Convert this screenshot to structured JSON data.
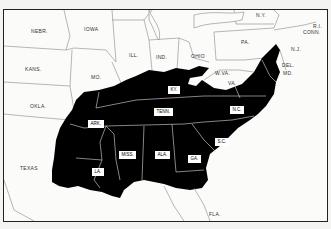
{
  "map": {
    "shaded_color": "#000000",
    "background_color": "#fbfbfa",
    "border_color": "#222222",
    "unshaded_states": [
      {
        "label": "NEBR.",
        "x": 27,
        "y": 18
      },
      {
        "label": "IOWA",
        "x": 80,
        "y": 16
      },
      {
        "label": "ILL.",
        "x": 125,
        "y": 42
      },
      {
        "label": "IND.",
        "x": 152,
        "y": 44
      },
      {
        "label": "OHIO",
        "x": 187,
        "y": 43
      },
      {
        "label": "PA.",
        "x": 237,
        "y": 29
      },
      {
        "label": "N.Y.",
        "x": 252,
        "y": 2
      },
      {
        "label": "N.J.",
        "x": 287,
        "y": 36
      },
      {
        "label": "CONN.",
        "x": 299,
        "y": 19
      },
      {
        "label": "R.I.",
        "x": 309,
        "y": 13
      },
      {
        "label": "DEL.",
        "x": 278,
        "y": 52
      },
      {
        "label": "MD.",
        "x": 279,
        "y": 60
      },
      {
        "label": "W.VA.",
        "x": 211,
        "y": 60
      },
      {
        "label": "VA.",
        "x": 224,
        "y": 70
      },
      {
        "label": "KANS.",
        "x": 21,
        "y": 56
      },
      {
        "label": "MO.",
        "x": 87,
        "y": 64
      },
      {
        "label": "OKLA.",
        "x": 26,
        "y": 93
      },
      {
        "label": "TEXAS",
        "x": 16,
        "y": 155
      },
      {
        "label": "FLA.",
        "x": 205,
        "y": 201
      }
    ],
    "shaded_states": [
      {
        "label": "KY.",
        "x": 164,
        "y": 76
      },
      {
        "label": "TENN.",
        "x": 150,
        "y": 98
      },
      {
        "label": "N.C.",
        "x": 226,
        "y": 96
      },
      {
        "label": "ARK.",
        "x": 84,
        "y": 110
      },
      {
        "label": "S.C.",
        "x": 211,
        "y": 128
      },
      {
        "label": "MISS.",
        "x": 115,
        "y": 141
      },
      {
        "label": "ALA.",
        "x": 151,
        "y": 141
      },
      {
        "label": "GA.",
        "x": 184,
        "y": 145
      },
      {
        "label": "LA.",
        "x": 88,
        "y": 158
      }
    ]
  }
}
